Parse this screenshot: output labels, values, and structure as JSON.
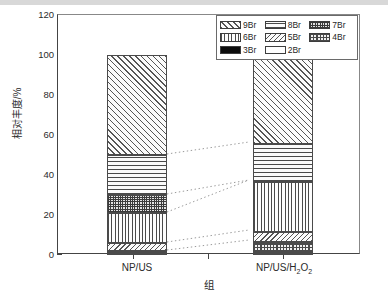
{
  "chart_data": {
    "type": "bar",
    "stacked": true,
    "title": "",
    "xlabel": "组",
    "ylabel": "相对丰度/%",
    "categories": [
      "NP/US",
      "NP/US/H2O2"
    ],
    "category_labels_html": [
      "NP/US",
      "NP/US/H<sub>2</sub>O<sub>2</sub>"
    ],
    "ylim": [
      0,
      120
    ],
    "yticks": [
      0,
      20,
      40,
      60,
      80,
      100,
      120
    ],
    "ytick_labels": [
      "0",
      "20",
      "40",
      "60",
      "80",
      "100",
      "120"
    ],
    "yminor_ticks": [
      10,
      30,
      50,
      70,
      90,
      110
    ],
    "grid": false,
    "legend_position": "top-right",
    "series": [
      {
        "name": "9Br",
        "pattern": "diagonal-forward",
        "values": [
          50,
          44
        ]
      },
      {
        "name": "8Br",
        "pattern": "horizontal-lines",
        "values": [
          20,
          19
        ]
      },
      {
        "name": "7Br",
        "pattern": "dense-crosshatch",
        "values": [
          9,
          0
        ]
      },
      {
        "name": "6Br",
        "pattern": "vertical-lines",
        "values": [
          15,
          25
        ]
      },
      {
        "name": "5Br",
        "pattern": "diagonal-back",
        "values": [
          4,
          5
        ]
      },
      {
        "name": "4Br",
        "pattern": "checkerboard",
        "values": [
          1,
          5
        ]
      },
      {
        "name": "3Br",
        "pattern": "solid-black",
        "values": [
          0.6,
          1
        ]
      },
      {
        "name": "2Br",
        "pattern": "empty-white",
        "values": [
          0.4,
          1
        ]
      }
    ],
    "cumulative_boundaries": {
      "NP/US": [
        0,
        0.4,
        1,
        2,
        6,
        21,
        30,
        50,
        100
      ],
      "NP/US/H2O2": [
        0,
        1,
        2,
        7,
        12,
        37,
        37,
        56,
        100
      ]
    },
    "annotations": "dotted connector lines link matching segment boundaries between the two stacked bars"
  },
  "legend": {
    "rows": [
      [
        {
          "label": "9Br",
          "pattern": "diagonal-forward"
        },
        {
          "label": "8Br",
          "pattern": "horizontal-lines"
        },
        {
          "label": "7Br",
          "pattern": "dense-crosshatch"
        }
      ],
      [
        {
          "label": "6Br",
          "pattern": "vertical-lines"
        },
        {
          "label": "5Br",
          "pattern": "diagonal-back"
        },
        {
          "label": "4Br",
          "pattern": "checkerboard"
        }
      ],
      [
        {
          "label": "3Br",
          "pattern": "solid-black"
        },
        {
          "label": "2Br",
          "pattern": "empty-white"
        }
      ]
    ]
  },
  "colors": {
    "axis": "#444444",
    "text": "#2b2b2b",
    "hatch": "#4a4a4a",
    "background": "#ffffff",
    "connector": "#9a9a9a",
    "solid_black_fill": "#0c0c0c"
  }
}
